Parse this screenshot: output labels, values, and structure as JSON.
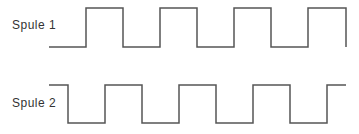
{
  "diagram": {
    "signals": [
      {
        "label": "Spule 1",
        "start_level": "low",
        "points": [
          [
            49,
            47
          ],
          [
            86,
            47
          ],
          [
            86,
            8
          ],
          [
            123,
            8
          ],
          [
            123,
            47
          ],
          [
            160,
            47
          ],
          [
            160,
            8
          ],
          [
            197,
            8
          ],
          [
            197,
            47
          ],
          [
            234,
            47
          ],
          [
            234,
            8
          ],
          [
            271,
            8
          ],
          [
            271,
            47
          ],
          [
            308,
            47
          ],
          [
            308,
            8
          ],
          [
            346,
            8
          ],
          [
            346,
            47
          ]
        ]
      },
      {
        "label": "Spule 2",
        "start_level": "high",
        "points": [
          [
            49,
            85
          ],
          [
            68,
            85
          ],
          [
            68,
            123
          ],
          [
            105,
            123
          ],
          [
            105,
            85
          ],
          [
            142,
            85
          ],
          [
            142,
            123
          ],
          [
            179,
            123
          ],
          [
            179,
            85
          ],
          [
            216,
            85
          ],
          [
            216,
            123
          ],
          [
            253,
            123
          ],
          [
            253,
            85
          ],
          [
            290,
            85
          ],
          [
            290,
            123
          ],
          [
            327,
            123
          ],
          [
            327,
            85
          ],
          [
            346,
            85
          ]
        ]
      }
    ],
    "line_color": "#555555",
    "line_width": 1.5
  }
}
